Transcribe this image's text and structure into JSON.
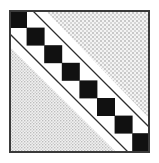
{
  "figure": {
    "title": "Heraldic bend compony",
    "canvas": {
      "width": 159,
      "height": 163
    },
    "colors": {
      "background": "#ffffff",
      "border": "#3a3a3a",
      "square_dark": "#111111",
      "square_light": "#ffffff",
      "stipple_dot": "#9a9a9a",
      "stipple_field": "#f2f2f2",
      "cotise_line": "#2e2e2e"
    },
    "frame": {
      "name": "escutcheon-frame",
      "x": 9,
      "y": 10,
      "width": 141,
      "height": 143,
      "stroke_width": 2
    },
    "band": {
      "name": "bend-compony",
      "direction": "upper-left-to-lower-right",
      "square_count": 8,
      "square_size": 18,
      "start_x": 9,
      "start_y": 10,
      "step_x": 17.6,
      "step_y": 17.6,
      "squares": [
        {
          "index": 0,
          "fill": "dark",
          "x": 9,
          "y": 10
        },
        {
          "index": 1,
          "fill": "dark",
          "x": 26.6,
          "y": 27.6
        },
        {
          "index": 2,
          "fill": "dark",
          "x": 44.2,
          "y": 45.2
        },
        {
          "index": 3,
          "fill": "dark",
          "x": 61.8,
          "y": 62.8
        },
        {
          "index": 4,
          "fill": "dark",
          "x": 79.4,
          "y": 80.4
        },
        {
          "index": 5,
          "fill": "dark",
          "x": 97.0,
          "y": 98.0
        },
        {
          "index": 6,
          "fill": "dark",
          "x": 114.6,
          "y": 115.6
        },
        {
          "index": 7,
          "fill": "dark",
          "x": 132.2,
          "y": 133.2
        }
      ]
    },
    "cotises": {
      "name": "paired-diagonal-lines",
      "upper_pair": [
        {
          "index": 0,
          "offset": 30
        },
        {
          "index": 1,
          "offset": 38
        }
      ],
      "lower_pair": [
        {
          "index": 0,
          "offset": -30
        },
        {
          "index": 1,
          "offset": -38
        }
      ],
      "stroke_width": 1.4
    },
    "shaded_regions": [
      {
        "name": "upper-right-triangle",
        "position": "upper-right",
        "texture": "stipple"
      },
      {
        "name": "lower-left-triangle",
        "position": "lower-left",
        "texture": "stipple"
      }
    ]
  }
}
